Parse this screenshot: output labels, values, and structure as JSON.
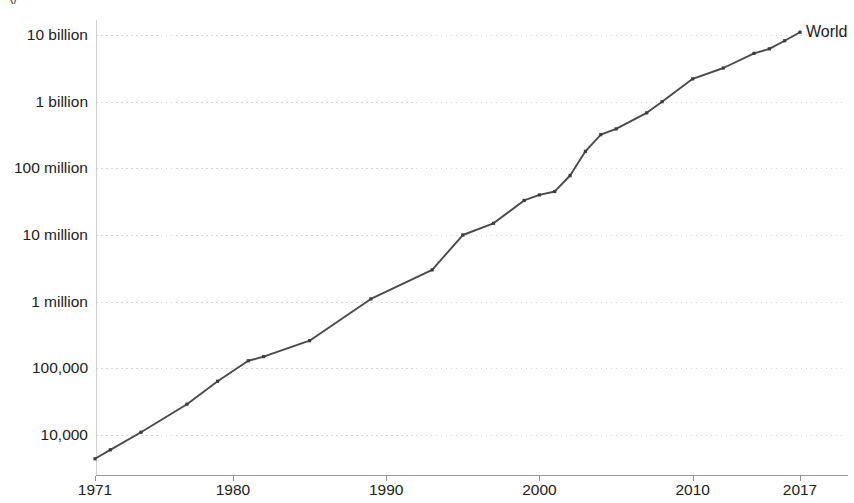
{
  "top_clipped_text": "y",
  "series_label": "World",
  "colors": {
    "line": "#4a4a4a",
    "marker": "#3d3d3d",
    "grid": "#c9c9c9",
    "axis": "#9a9a9a",
    "text": "#222222",
    "background": "#ffffff"
  },
  "chart_data": {
    "type": "line",
    "title": "",
    "subtitle": "",
    "xlabel": "",
    "ylabel": "",
    "yscale": "log",
    "grid": true,
    "legend_position": "end-of-line",
    "xlim": [
      1971,
      2017
    ],
    "ylim": [
      4400,
      13000000000
    ],
    "xtick_labels": [
      "1971",
      "1980",
      "1990",
      "2000",
      "2010",
      "2017"
    ],
    "xtick_values": [
      1971,
      1980,
      1990,
      2000,
      2010,
      2017
    ],
    "ytick_labels": [
      "10 billion",
      "1 billion",
      "100 million",
      "10 million",
      "1 million",
      "100,000",
      "10,000"
    ],
    "ytick_values": [
      10000000000,
      1000000000,
      100000000,
      10000000,
      1000000,
      100000,
      10000
    ],
    "series": [
      {
        "name": "World",
        "x": [
          1971,
          1972,
          1974,
          1977,
          1979,
          1981,
          1982,
          1985,
          1989,
          1993,
          1995,
          1997,
          1999,
          2000,
          2001,
          2002,
          2003,
          2004,
          2005,
          2007,
          2008,
          2010,
          2012,
          2014,
          2015,
          2016,
          2017
        ],
        "y": [
          4400,
          6000,
          11000,
          29000,
          64000,
          130000,
          150000,
          260000,
          1100000,
          3000000,
          10000000,
          15000000,
          33000000,
          40000000,
          45000000,
          78000000,
          180000000,
          320000000,
          390000000,
          680000000,
          1000000000,
          2200000000,
          3200000000,
          5300000000,
          6200000000,
          8200000000,
          11000000000
        ]
      }
    ]
  }
}
